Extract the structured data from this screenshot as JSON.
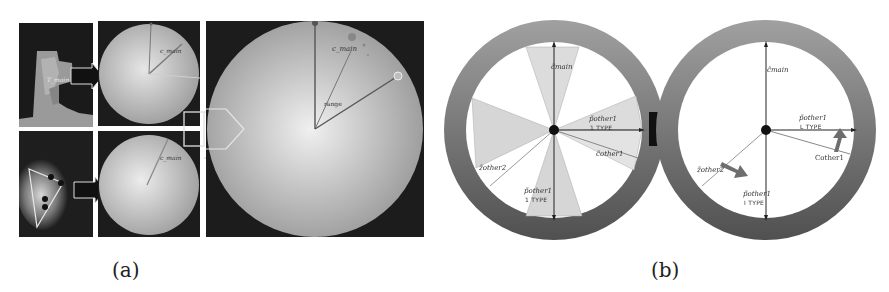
{
  "figure": {
    "panel_a": {
      "caption": "(a)",
      "top_row": {
        "depth_label": "T_main",
        "polar_label": "c_main"
      },
      "bottom_row": {
        "polar_label": "c_main"
      },
      "zoom_view": {
        "sector_label": "c_main",
        "range_label": "range"
      }
    },
    "panel_b": {
      "caption": "(b)",
      "left_wheel": {
        "labels": {
          "c_main": "c̃main",
          "p_other1_right": "p̃other1",
          "p_other1_right_type": "1 TYPE",
          "c_other1": "c̃other1",
          "z_other2": "z̃other2",
          "p_other1_bottom": "p̃other1",
          "p_other1_bottom_type": "1 TYPE"
        }
      },
      "right_wheel": {
        "labels": {
          "c_main": "c̃main",
          "p_other1_right": "p̃other1",
          "p_other1_right_type": "L TYPE",
          "c_other1": "Cother1",
          "z_other2": "z̃other2",
          "p_other1_bottom": "p̃other1",
          "p_other1_bottom_type": "I TYPE"
        }
      }
    }
  },
  "colors": {
    "dark_bg": "#1c1c1c",
    "ring_outer": "#5a5a5a",
    "ring_inner": "#a8a8a8",
    "sector_fill": "#d9d9d9",
    "arrow_fill": "#111111",
    "gray_arrow": "#6e6e6e"
  }
}
